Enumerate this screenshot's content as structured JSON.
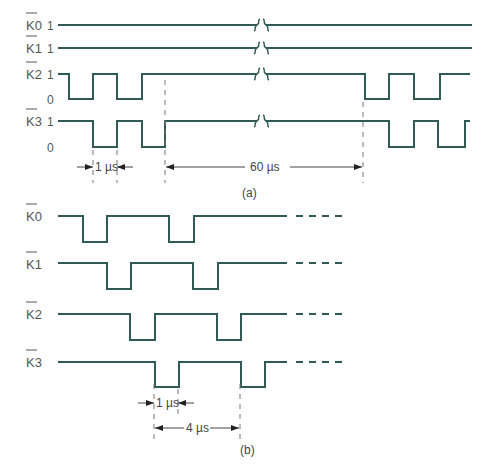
{
  "figure": {
    "part_a": {
      "caption": "(a)",
      "signals": [
        {
          "name": "K0",
          "label": "K0",
          "overbar": true,
          "levels": [
            "1"
          ],
          "pattern": "constant high across break"
        },
        {
          "name": "K1",
          "label": "K1",
          "overbar": true,
          "levels": [
            "1"
          ],
          "pattern": "constant high across break"
        },
        {
          "name": "K2",
          "label": "K2",
          "overbar": true,
          "levels": [
            "1",
            "0"
          ],
          "pattern": "two 1µs low pulses, long high (break), two low pulses"
        },
        {
          "name": "K3",
          "label": "K3",
          "overbar": true,
          "levels": [
            "1",
            "0"
          ],
          "pattern": "two 1µs low pulses offset 1µs from K2, long high (break), two low pulses"
        }
      ],
      "level_one": "1",
      "level_zero": "0",
      "dimensions": {
        "pulse_width": "1 µs",
        "gap": "60 µs"
      }
    },
    "part_b": {
      "caption": "(b)",
      "signals": [
        {
          "name": "K0",
          "label": "K0",
          "overbar": true
        },
        {
          "name": "K1",
          "label": "K1",
          "overbar": true
        },
        {
          "name": "K2",
          "label": "K2",
          "overbar": true
        },
        {
          "name": "K3",
          "label": "K3",
          "overbar": true
        }
      ],
      "dimensions": {
        "pulse_width": "1 µs",
        "period": "4 µs"
      }
    },
    "colors": {
      "waveform": "#2f5a55",
      "label_text": "#555555",
      "guide_lines": "#777777"
    }
  }
}
